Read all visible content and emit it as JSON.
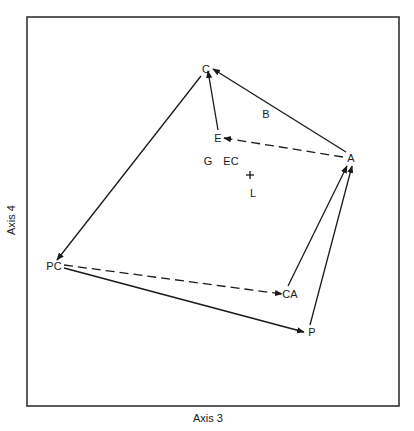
{
  "diagram": {
    "type": "ordination-plot",
    "xlabel": "Axis 3",
    "ylabel": "Axis 4",
    "frame": {
      "left": 27,
      "top": 17,
      "right": 399,
      "bottom": 406
    },
    "points": [
      {
        "id": "C",
        "label": "C",
        "x": 206,
        "y": 73
      },
      {
        "id": "B",
        "label": "B",
        "x": 266,
        "y": 118
      },
      {
        "id": "E",
        "label": "E",
        "x": 218,
        "y": 142
      },
      {
        "id": "A",
        "label": "A",
        "x": 351,
        "y": 162
      },
      {
        "id": "G",
        "label": "G",
        "x": 208,
        "y": 165
      },
      {
        "id": "EC",
        "label": "EC",
        "x": 231,
        "y": 165
      },
      {
        "id": "L",
        "label": "L",
        "x": 253,
        "y": 197
      },
      {
        "id": "PC",
        "label": "PC",
        "x": 54,
        "y": 270
      },
      {
        "id": "CA",
        "label": "CA",
        "x": 290,
        "y": 298
      },
      {
        "id": "P",
        "label": "P",
        "x": 312,
        "y": 336
      }
    ],
    "centroid": {
      "symbol": "+",
      "x": 250,
      "y": 175
    },
    "edges": [
      {
        "from": "E",
        "to": "C",
        "style": "solid",
        "x1": 218,
        "y1": 130,
        "x2": 208,
        "y2": 71
      },
      {
        "from": "A",
        "to": "C",
        "style": "solid",
        "x1": 346,
        "y1": 152,
        "x2": 213,
        "y2": 69
      },
      {
        "from": "A",
        "to": "E",
        "style": "dashed",
        "x1": 343,
        "y1": 157,
        "x2": 224,
        "y2": 138
      },
      {
        "from": "C",
        "to": "PC",
        "style": "solid",
        "x1": 201,
        "y1": 76,
        "x2": 57,
        "y2": 260
      },
      {
        "from": "PC",
        "to": "CA",
        "style": "dashed",
        "x1": 64,
        "y1": 265,
        "x2": 282,
        "y2": 294
      },
      {
        "from": "PC",
        "to": "P",
        "style": "solid",
        "x1": 64,
        "y1": 268,
        "x2": 304,
        "y2": 332
      },
      {
        "from": "CA",
        "to": "A",
        "style": "solid",
        "x1": 288,
        "y1": 286,
        "x2": 347,
        "y2": 166
      },
      {
        "from": "P",
        "to": "A",
        "style": "solid",
        "x1": 310,
        "y1": 325,
        "x2": 352,
        "y2": 166
      }
    ],
    "colors": {
      "line": "#1a1a1a",
      "frame": "#333333",
      "background": "#ffffff"
    }
  }
}
